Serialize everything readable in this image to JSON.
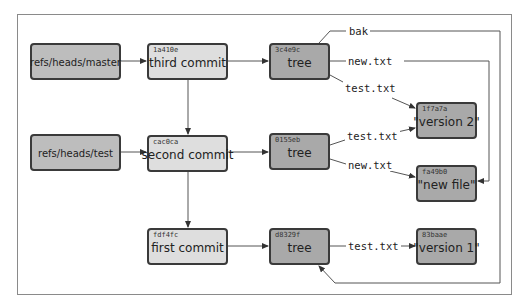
{
  "diagram": {
    "refs": [
      {
        "id": "master",
        "label": "refs/heads/master"
      },
      {
        "id": "test",
        "label": "refs/heads/test"
      }
    ],
    "commits": [
      {
        "hash": "1a410e",
        "label": "third commit"
      },
      {
        "hash": "cac0ca",
        "label": "second commit"
      },
      {
        "hash": "fdf4fc",
        "label": "first commit"
      }
    ],
    "trees": [
      {
        "hash": "3c4e9c",
        "label": "tree"
      },
      {
        "hash": "0155eb",
        "label": "tree"
      },
      {
        "hash": "d8329f",
        "label": "tree"
      }
    ],
    "blobs": [
      {
        "hash": "1f7a7a",
        "label": "\"version 2\""
      },
      {
        "hash": "fa49b0",
        "label": "\"new file\""
      },
      {
        "hash": "83baae",
        "label": "\"version 1\""
      }
    ],
    "edge_labels": {
      "bak": "bak",
      "t1_new": "new.txt",
      "t1_test": "test.txt",
      "t2_test": "test.txt",
      "t2_new": "new.txt",
      "t3_test": "test.txt"
    },
    "colors": {
      "ref_fill": "#bdbdbd",
      "commit_fill": "#dedede",
      "object_fill": "#a9a9a9",
      "border": "#3a3a3a",
      "line": "#555555"
    }
  }
}
